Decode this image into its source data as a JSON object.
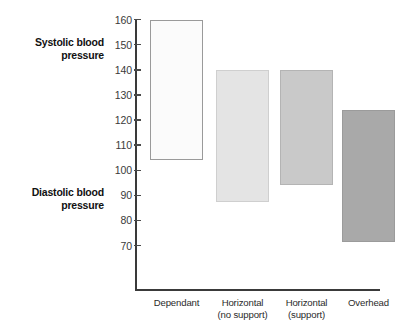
{
  "chart_data": {
    "type": "bar",
    "subtype": "floating-range-bar",
    "title": "",
    "xlabel": "",
    "ylabel": "",
    "ylim": [
      60,
      163
    ],
    "y_ticks": [
      70,
      80,
      90,
      100,
      110,
      120,
      130,
      140,
      150,
      160
    ],
    "grid": false,
    "legend": false,
    "categories": [
      "Dependant",
      "Horizontal (no support)",
      "Horizontal (support)",
      "Overhead"
    ],
    "category_lines": [
      [
        "Dependant",
        ""
      ],
      [
        "Horizontal",
        "(no support)"
      ],
      [
        "Horizontal",
        "(support)"
      ],
      [
        "Overhead",
        ""
      ]
    ],
    "series": [
      {
        "name": "Systolic blood pressure",
        "values": [
          160,
          140,
          140,
          124
        ]
      },
      {
        "name": "Diastolic blood pressure",
        "values": [
          104,
          87.5,
          94,
          71.5
        ]
      }
    ],
    "bars": [
      {
        "category": "Dependant",
        "low": 104,
        "high": 160,
        "fill": "#fbfbfb",
        "stroke": "#9a9a9a"
      },
      {
        "category": "Horizontal (no support)",
        "low": 87.5,
        "high": 140,
        "fill": "#e4e4e4",
        "stroke": "#cfcfcf"
      },
      {
        "category": "Horizontal (support)",
        "low": 94,
        "high": 140,
        "fill": "#c9c9c9",
        "stroke": "#b4b4b4"
      },
      {
        "category": "Overhead",
        "low": 71.5,
        "high": 124,
        "fill": "#a9a9a9",
        "stroke": "#9b9b9b"
      }
    ],
    "annotations": [
      {
        "name": "systolic-label",
        "text_lines": [
          "Systolic blood",
          "pressure"
        ],
        "at_value": 150
      },
      {
        "name": "diastolic-label",
        "text_lines": [
          "Diastolic blood",
          "pressure"
        ],
        "at_value": 85
      }
    ]
  },
  "labels": {
    "systolic_line1": "Systolic blood",
    "systolic_line2": "pressure",
    "diastolic_line1": "Diastolic blood",
    "diastolic_line2": "pressure"
  },
  "axis": {
    "tick_labels": [
      "160",
      "150",
      "140",
      "130",
      "120",
      "110",
      "100",
      "90",
      "80",
      "70"
    ]
  },
  "colors": {
    "axis": "#3a3a3a",
    "text": "#1a1a1a",
    "bar_1": "#fbfbfb",
    "bar_2": "#e4e4e4",
    "bar_3": "#c9c9c9",
    "bar_4": "#a9a9a9"
  }
}
